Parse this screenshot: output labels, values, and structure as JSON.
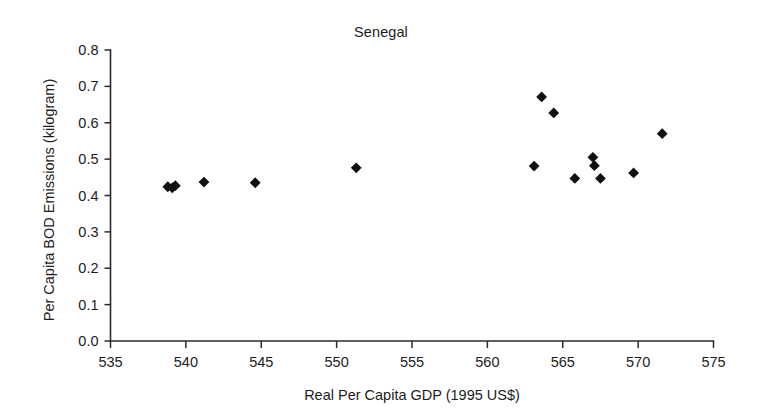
{
  "chart_data": {
    "type": "scatter",
    "title": "Senegal",
    "xlabel": "Real Per Capita GDP (1995 US$)",
    "ylabel": "Per Capita BOD Emissions (kilogram)",
    "xlim": [
      535,
      575
    ],
    "ylim": [
      0.0,
      0.8
    ],
    "xticks": [
      535,
      540,
      545,
      550,
      555,
      560,
      565,
      570,
      575
    ],
    "xtick_labels": [
      "535",
      "540",
      "545",
      "550",
      "555",
      "560",
      "565",
      "570",
      "575"
    ],
    "yticks": [
      0.0,
      0.1,
      0.2,
      0.3,
      0.4,
      0.5,
      0.6,
      0.7,
      0.8
    ],
    "ytick_labels": [
      "0.0",
      "0.1",
      "0.2",
      "0.3",
      "0.4",
      "0.5",
      "0.6",
      "0.7",
      "0.8"
    ],
    "grid": false,
    "legend": false,
    "marker_shape": "diamond",
    "marker_color": "#101010",
    "series": [
      {
        "name": "Senegal",
        "points": [
          {
            "x": 538.8,
            "y": 0.424
          },
          {
            "x": 539.1,
            "y": 0.421
          },
          {
            "x": 539.3,
            "y": 0.427
          },
          {
            "x": 541.2,
            "y": 0.437
          },
          {
            "x": 544.6,
            "y": 0.435
          },
          {
            "x": 551.3,
            "y": 0.476
          },
          {
            "x": 563.1,
            "y": 0.481
          },
          {
            "x": 563.6,
            "y": 0.671
          },
          {
            "x": 564.4,
            "y": 0.627
          },
          {
            "x": 565.8,
            "y": 0.447
          },
          {
            "x": 567.0,
            "y": 0.505
          },
          {
            "x": 567.1,
            "y": 0.482
          },
          {
            "x": 567.5,
            "y": 0.447
          },
          {
            "x": 569.7,
            "y": 0.462
          },
          {
            "x": 571.6,
            "y": 0.57
          }
        ]
      }
    ]
  },
  "axes": {
    "title": "Senegal",
    "x_axis_title": "Real Per Capita GDP (1995 US$)",
    "y_axis_title": "Per Capita BOD Emissions (kilogram)"
  }
}
